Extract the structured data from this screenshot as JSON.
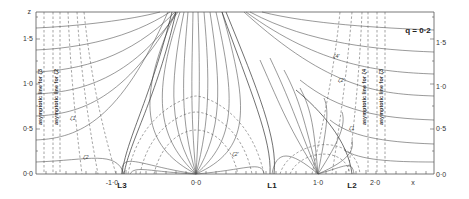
{
  "figure": {
    "parameter_label": "q = 0·2",
    "y_axis_label": "z",
    "x_axis_label": "x",
    "y_ticks_left": [
      "0·0",
      "0·5",
      "1·0",
      "1·5"
    ],
    "y_ticks_right": [
      "0·0",
      "0·5",
      "1·0",
      "1·5"
    ],
    "x_ticks": [
      "-1·0",
      "0·0",
      "1·0",
      "2·0"
    ],
    "lagrange_points": [
      "L3",
      "L1",
      "L2"
    ],
    "asymptotic_labels": {
      "left_outer": "asymptotic line for ζ3",
      "left_inner": "asymptotic line for ζ2",
      "right_inner": "asymptotic line for ζ4",
      "right_outer": "asymptotic line for ζ3"
    },
    "curve_labels": [
      "ζ1",
      "ζ2",
      "ζ2'",
      "ζ4'",
      "ζ2'",
      "ζ1"
    ]
  },
  "colors": {
    "line": "#555555",
    "background": "#ffffff"
  }
}
